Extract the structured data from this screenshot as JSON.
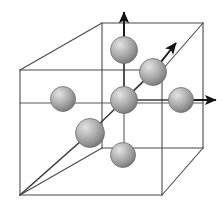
{
  "figure": {
    "type": "crystal-lattice-diagram",
    "canvas": {
      "width": 222,
      "height": 223
    },
    "background_color": "#ffffff"
  },
  "style": {
    "edge_color": "#4a4a4a",
    "edge_width": 1.1,
    "inner_edge_color": "#5a5a5a",
    "inner_edge_width": 1.1,
    "vector_color": "#1a1a1a",
    "vector_width": 2.0,
    "bond_color": "#3c3c3c",
    "bond_width": 1.6,
    "sphere_fill_light": "#d8d8d8",
    "sphere_fill_mid": "#a8a8a8",
    "sphere_fill_dark": "#7c7c7c",
    "sphere_stroke": "#6f6f6f",
    "sphere_stroke_width": 0.8,
    "highlight_offset": {
      "cx": "35%",
      "cy": "32%"
    }
  },
  "cube": {
    "name": "unit-cell-cube",
    "vertices": {
      "front_top_left": {
        "x": 20,
        "y": 70
      },
      "front_top_right": {
        "x": 162,
        "y": 70
      },
      "front_bottom_left": {
        "x": 20,
        "y": 195
      },
      "front_bottom_right": {
        "x": 162,
        "y": 195
      },
      "back_top_left": {
        "x": 102,
        "y": 23
      },
      "back_top_right": {
        "x": 203,
        "y": 23
      },
      "back_bottom_left": {
        "x": 102,
        "y": 148
      },
      "back_bottom_right": {
        "x": 203,
        "y": 148
      }
    },
    "edges": [
      {
        "name": "front-face-top",
        "from": "front_top_left",
        "to": "front_top_right"
      },
      {
        "name": "front-face-right",
        "from": "front_top_right",
        "to": "front_bottom_right"
      },
      {
        "name": "front-face-bottom",
        "from": "front_bottom_right",
        "to": "front_bottom_left"
      },
      {
        "name": "front-face-left",
        "from": "front_bottom_left",
        "to": "front_top_left"
      },
      {
        "name": "back-face-top",
        "from": "back_top_left",
        "to": "back_top_right"
      },
      {
        "name": "back-face-right",
        "from": "back_top_right",
        "to": "back_bottom_right"
      },
      {
        "name": "back-face-bottom",
        "from": "back_bottom_right",
        "to": "back_bottom_left"
      },
      {
        "name": "back-face-left",
        "from": "back_bottom_left",
        "to": "back_top_left"
      },
      {
        "name": "connector-top-left",
        "from": "front_top_left",
        "to": "back_top_left"
      },
      {
        "name": "connector-top-right",
        "from": "front_top_right",
        "to": "back_top_right"
      },
      {
        "name": "connector-bottom-left",
        "from": "front_bottom_left",
        "to": "back_bottom_left"
      },
      {
        "name": "connector-bottom-right",
        "from": "front_bottom_right",
        "to": "back_bottom_right"
      }
    ]
  },
  "atoms": [
    {
      "name": "atom-back-face-top",
      "label": "back face centre (upper)",
      "cx": 124,
      "cy": 50,
      "r": 13.5
    },
    {
      "name": "atom-origin-corner",
      "label": "origin corner atom",
      "cx": 124,
      "cy": 100,
      "r": 13.5
    },
    {
      "name": "atom-diagonal-face",
      "label": "face centre on body diagonal",
      "cx": 153,
      "cy": 72,
      "r": 13.5
    },
    {
      "name": "atom-right-face",
      "label": "right face centre",
      "cx": 181,
      "cy": 100,
      "r": 12.5
    },
    {
      "name": "atom-left-face",
      "label": "left face centre",
      "cx": 63,
      "cy": 99,
      "r": 12.5
    },
    {
      "name": "atom-front-face-lower",
      "label": "front face centre",
      "cx": 90,
      "cy": 133,
      "r": 14.5
    },
    {
      "name": "atom-bottom-face",
      "label": "bottom face centre",
      "cx": 123,
      "cy": 155,
      "r": 12.5
    }
  ],
  "bonds": [
    {
      "name": "bond-vertical-origin-to-top",
      "x1": 124,
      "y1": 100,
      "x2": 124,
      "y2": 50
    },
    {
      "name": "bond-origin-to-diagonal-face",
      "x1": 124,
      "y1": 100,
      "x2": 153,
      "y2": 72
    },
    {
      "name": "bond-origin-to-right-face",
      "x1": 124,
      "y1": 100,
      "x2": 181,
      "y2": 100
    },
    {
      "name": "bond-front-face-to-bottom-corner",
      "x1": 90,
      "y1": 133,
      "x2": 20,
      "y2": 195
    },
    {
      "name": "bond-front-face-to-diagonal",
      "x1": 90,
      "y1": 133,
      "x2": 153,
      "y2": 72
    }
  ],
  "vectors": [
    {
      "name": "lattice-vector-a3-up",
      "direction": "vertical up",
      "x1": 124,
      "y1": 50,
      "x2": 124,
      "y2": 12,
      "arrowhead": true
    },
    {
      "name": "lattice-vector-a2-diagonal",
      "direction": "up-right diagonal",
      "x1": 153,
      "y1": 72,
      "x2": 176,
      "y2": 43,
      "arrowhead": true
    },
    {
      "name": "lattice-vector-a1-right",
      "direction": "horizontal right",
      "x1": 181,
      "y1": 100,
      "x2": 216,
      "y2": 100,
      "arrowhead": true
    }
  ],
  "inner_lines": [
    {
      "name": "inner-vertical-through-origin",
      "x1": 124,
      "y1": 23,
      "x2": 124,
      "y2": 148
    },
    {
      "name": "inner-horizontal-mid",
      "x1": 20,
      "y1": 103,
      "x2": 203,
      "y2": 103
    }
  ]
}
